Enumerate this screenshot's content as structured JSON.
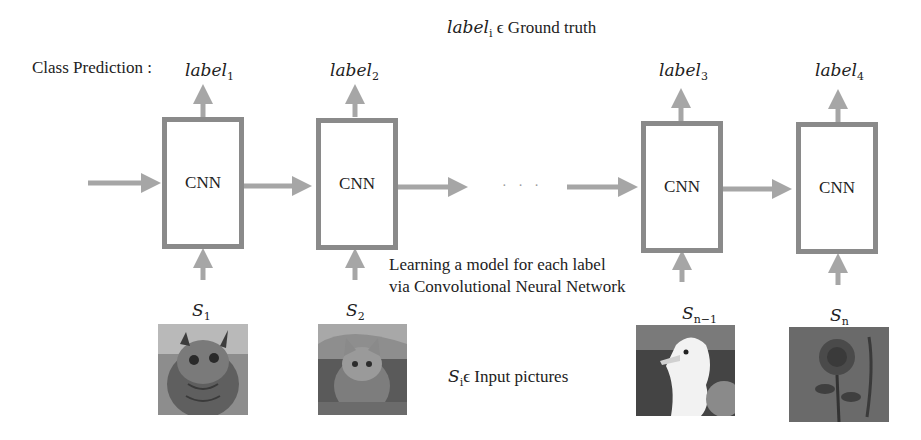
{
  "header": {
    "ground_truth_label": "label",
    "ground_truth_sub": "i",
    "ground_truth_text": " ϵ Ground truth"
  },
  "row_label": "Class Prediction :",
  "labels": [
    {
      "base": "label",
      "sub": "1"
    },
    {
      "base": "label",
      "sub": "2"
    },
    {
      "base": "label",
      "sub": "3"
    },
    {
      "base": "label",
      "sub": "4"
    }
  ],
  "cnn_blocks": [
    {
      "text": "CNN"
    },
    {
      "text": "CNN"
    },
    {
      "text": "CNN"
    },
    {
      "text": "CNN"
    }
  ],
  "ellipsis": "· · ·",
  "description": {
    "line1": "Learning a model for each label",
    "line2": "via Convolutional Neural Network"
  },
  "inputs": [
    {
      "base": "S",
      "sub": "1",
      "picture": "owl"
    },
    {
      "base": "S",
      "sub": "2",
      "picture": "cat"
    },
    {
      "base": "S",
      "sub": "n−1",
      "picture": "seagull"
    },
    {
      "base": "S",
      "sub": "n",
      "picture": "rose"
    }
  ],
  "input_caption": {
    "base": "S",
    "sub": "i",
    "text": "ϵ Input pictures"
  },
  "colors": {
    "arrow": "#a6a6a6",
    "box_border": "#8a8a8a",
    "text": "#222222"
  }
}
